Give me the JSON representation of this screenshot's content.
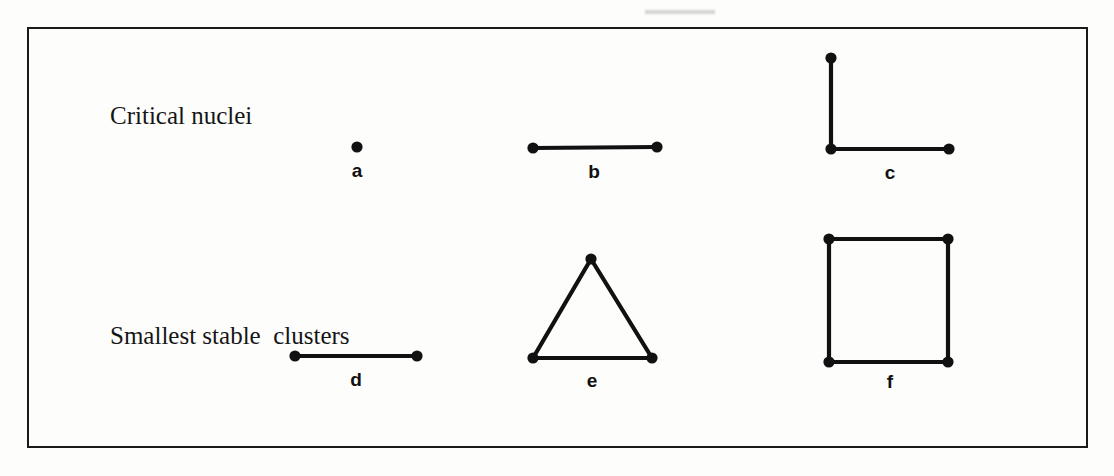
{
  "figure": {
    "background_color": "#fdfdfc",
    "ink_color": "#111111",
    "frame": {
      "x": 27,
      "y": 27,
      "width": 1061,
      "height": 421,
      "border_width": 2
    },
    "rows": [
      {
        "id": "critical-nuclei",
        "caption": "Critical nuclei"
      },
      {
        "id": "smallest-stable",
        "caption": "Smallest stable  clusters"
      }
    ],
    "panels": [
      {
        "id": "a",
        "label": "a",
        "row": "critical-nuclei",
        "shape": "monomer",
        "description": "single atom",
        "label_x": 357,
        "label_y": 161,
        "atoms": [
          {
            "x": 357,
            "y": 147
          }
        ],
        "bonds": []
      },
      {
        "id": "b",
        "label": "b",
        "row": "critical-nuclei",
        "shape": "dimer",
        "description": "two atoms joined by one horizontal bond",
        "label_x": 594,
        "label_y": 162,
        "atoms": [
          {
            "x": 533,
            "y": 148
          },
          {
            "x": 657,
            "y": 147
          }
        ],
        "bonds": [
          {
            "x1": 533,
            "y1": 148,
            "x2": 657,
            "y2": 147
          }
        ]
      },
      {
        "id": "c",
        "label": "c",
        "row": "critical-nuclei",
        "shape": "bent-trimer",
        "description": "three atoms forming an L / right angle",
        "label_x": 890,
        "label_y": 163,
        "atoms": [
          {
            "x": 831,
            "y": 58
          },
          {
            "x": 831,
            "y": 149
          },
          {
            "x": 949,
            "y": 149
          }
        ],
        "bonds": [
          {
            "x1": 831,
            "y1": 58,
            "x2": 831,
            "y2": 149
          },
          {
            "x1": 831,
            "y1": 149,
            "x2": 949,
            "y2": 149
          }
        ]
      },
      {
        "id": "d",
        "label": "d",
        "row": "smallest-stable",
        "shape": "dimer",
        "description": "two atoms joined by one horizontal bond",
        "label_x": 356,
        "label_y": 370,
        "atoms": [
          {
            "x": 295,
            "y": 356
          },
          {
            "x": 417,
            "y": 356
          }
        ],
        "bonds": [
          {
            "x1": 295,
            "y1": 356,
            "x2": 417,
            "y2": 356
          }
        ]
      },
      {
        "id": "e",
        "label": "e",
        "row": "smallest-stable",
        "shape": "triangle-trimer",
        "description": "three atoms forming a closed triangle",
        "label_x": 592,
        "label_y": 371,
        "atoms": [
          {
            "x": 591,
            "y": 259
          },
          {
            "x": 533,
            "y": 358
          },
          {
            "x": 652,
            "y": 358
          }
        ],
        "bonds": [
          {
            "x1": 591,
            "y1": 259,
            "x2": 533,
            "y2": 358
          },
          {
            "x1": 591,
            "y1": 259,
            "x2": 652,
            "y2": 358
          },
          {
            "x1": 533,
            "y1": 358,
            "x2": 652,
            "y2": 358
          }
        ]
      },
      {
        "id": "f",
        "label": "f",
        "row": "smallest-stable",
        "shape": "square-tetramer",
        "description": "four atoms forming a closed square",
        "label_x": 890,
        "label_y": 372,
        "atoms": [
          {
            "x": 829,
            "y": 239
          },
          {
            "x": 948,
            "y": 239
          },
          {
            "x": 948,
            "y": 362
          },
          {
            "x": 829,
            "y": 362
          }
        ],
        "bonds": [
          {
            "x1": 829,
            "y1": 239,
            "x2": 948,
            "y2": 239
          },
          {
            "x1": 948,
            "y1": 239,
            "x2": 948,
            "y2": 362
          },
          {
            "x1": 948,
            "y1": 362,
            "x2": 829,
            "y2": 362
          },
          {
            "x1": 829,
            "y1": 362,
            "x2": 829,
            "y2": 239
          }
        ]
      }
    ],
    "atom_radius": 5.6,
    "bond_width": 4.2
  }
}
